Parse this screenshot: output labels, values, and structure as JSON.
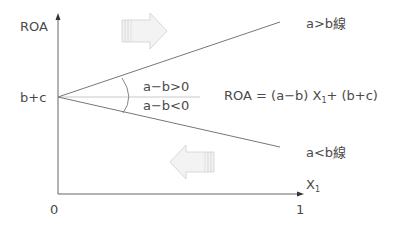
{
  "axes": {
    "y_label": "ROA",
    "x_label": "X",
    "x_label_sub": "1",
    "origin_label": "0",
    "x_end_label": "1",
    "intercept_label": "b+c"
  },
  "lines": {
    "upper_label": "a>b線",
    "lower_label": "a<b線"
  },
  "conditions": {
    "positive": "a−b>0",
    "negative": "a−b<0"
  },
  "equation": {
    "lhs": "ROA = (a−b) X",
    "sub": "1",
    "rhs": "+ (b+c)"
  },
  "arrows": {
    "upper": "right-arrow",
    "lower": "left-arrow"
  },
  "colors": {
    "axis": "#555555",
    "line": "#777777",
    "arrow_fill": "#f2f2f2",
    "arrow_stroke": "#cccccc"
  }
}
